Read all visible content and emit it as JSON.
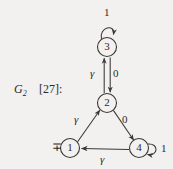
{
  "figure": {
    "graph_label": "G",
    "graph_subscript": "2",
    "citation": "[27]:",
    "initial_marker": "∓",
    "nodes": [
      {
        "id": "n1",
        "label": "1",
        "cx": 70,
        "cy": 148,
        "r": 9.5
      },
      {
        "id": "n2",
        "label": "2",
        "cx": 107,
        "cy": 103,
        "r": 9.5
      },
      {
        "id": "n3",
        "label": "3",
        "cx": 107,
        "cy": 47,
        "r": 9.5
      },
      {
        "id": "n4",
        "label": "4",
        "cx": 139,
        "cy": 148,
        "r": 9.5
      }
    ],
    "edges": [
      {
        "from": "3",
        "to": "3",
        "label": "1",
        "kind": "self-loop-top"
      },
      {
        "from": "2",
        "to": "3",
        "label": "γ",
        "kind": "vertical-up"
      },
      {
        "from": "3",
        "to": "2",
        "label": "0",
        "kind": "vertical-down"
      },
      {
        "from": "1",
        "to": "2",
        "label": "γ",
        "kind": "diagonal-up-right"
      },
      {
        "from": "2",
        "to": "4",
        "label": "0",
        "kind": "diagonal-down-right"
      },
      {
        "from": "4",
        "to": "1",
        "label": "γ",
        "kind": "horizontal-left"
      },
      {
        "from": "4",
        "to": "4",
        "label": "1",
        "kind": "self-loop-right"
      }
    ],
    "colors": {
      "background": "#f2f1ef",
      "ink": "#3a3836"
    }
  }
}
